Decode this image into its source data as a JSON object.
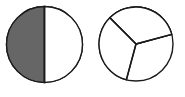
{
  "figure": {
    "name": "fraction-pie-pair",
    "background_color": "#ffffff",
    "shade_color": "#666666",
    "unshaded_color": "#ffffff",
    "stroke_color": "#1a1a1a",
    "stroke_width": 1.4
  },
  "chart_data": {
    "type": "pie",
    "title": "",
    "charts": [
      {
        "id": "left-pie",
        "name": "half-circle-pie",
        "center": {
          "x": 44.5,
          "y": 44.5
        },
        "radius": 38,
        "slice_count": 2,
        "shaded_count": 1,
        "fraction_label": "1/2",
        "categories": [
          "shaded",
          "unshaded"
        ],
        "values": [
          1,
          2
        ],
        "slices": [
          {
            "name": "right-half-shaded",
            "start_angle_deg": 90,
            "end_angle_deg": 270,
            "sweep_deg": 180,
            "fill": "#666666",
            "shaded": true
          },
          {
            "name": "left-half-unshaded",
            "start_angle_deg": 270,
            "end_angle_deg": 450,
            "sweep_deg": 180,
            "fill": "#ffffff",
            "shaded": false
          }
        ]
      },
      {
        "id": "right-pie",
        "name": "thirds-circle-pie",
        "center": {
          "x": 136,
          "y": 44
        },
        "radius": 37,
        "slice_count": 3,
        "shaded_count": 1,
        "fraction_label": "1/3",
        "categories": [
          "shaded",
          "unshaded"
        ],
        "values": [
          1,
          3
        ],
        "slices": [
          {
            "name": "right-third-shaded",
            "start_angle_deg": 15,
            "end_angle_deg": 255,
            "sweep_deg": 120,
            "fill": "#666666",
            "shaded": true
          },
          {
            "name": "upper-third-unshaded",
            "start_angle_deg": 15,
            "end_angle_deg": 135,
            "sweep_deg": 120,
            "fill": "#ffffff",
            "shaded": false
          },
          {
            "name": "left-third-unshaded",
            "start_angle_deg": 135,
            "end_angle_deg": 255,
            "sweep_deg": 120,
            "fill": "#ffffff",
            "shaded": false
          }
        ]
      }
    ]
  }
}
